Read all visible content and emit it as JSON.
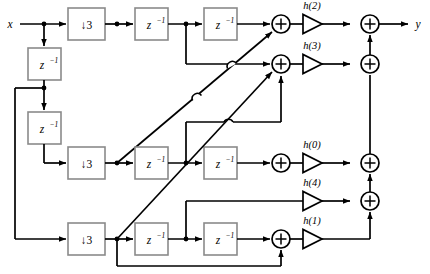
{
  "diagram": {
    "io": {
      "input_label": "x",
      "output_label": "y"
    },
    "downsamplers": [
      {
        "id": "dn1",
        "label": "↓3"
      },
      {
        "id": "dn2",
        "label": "↓3"
      },
      {
        "id": "dn3",
        "label": "↓3"
      }
    ],
    "delays": [
      {
        "id": "d1",
        "base": "z",
        "exp": "−1"
      },
      {
        "id": "d2",
        "base": "z",
        "exp": "−1"
      },
      {
        "id": "d3",
        "base": "z",
        "exp": "−1"
      },
      {
        "id": "d4",
        "base": "z",
        "exp": "−1"
      },
      {
        "id": "d5",
        "base": "z",
        "exp": "−1"
      },
      {
        "id": "d6",
        "base": "z",
        "exp": "−1"
      },
      {
        "id": "d7",
        "base": "z",
        "exp": "−1"
      },
      {
        "id": "d8",
        "base": "z",
        "exp": "−1"
      }
    ],
    "coefficients": [
      {
        "id": "h2",
        "label": "h(2)"
      },
      {
        "id": "h3",
        "label": "h(3)"
      },
      {
        "id": "h0",
        "label": "h(0)"
      },
      {
        "id": "h4",
        "label": "h(4)"
      },
      {
        "id": "h1",
        "label": "h(1)"
      }
    ],
    "adders": [
      {
        "id": "a1",
        "symbol": "+"
      },
      {
        "id": "a2",
        "symbol": "+"
      },
      {
        "id": "a3",
        "symbol": "+"
      },
      {
        "id": "a4",
        "symbol": "+"
      },
      {
        "id": "s1",
        "symbol": "+"
      },
      {
        "id": "s2",
        "symbol": "+"
      },
      {
        "id": "s3",
        "symbol": "+"
      }
    ],
    "colors": {
      "wire": "#000000",
      "block_border": "#8a8a8a",
      "background": "#ffffff"
    }
  }
}
